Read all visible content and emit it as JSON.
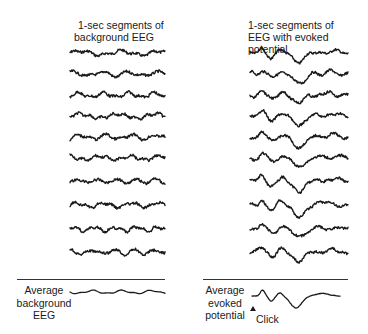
{
  "left_panel": {
    "title_line1": "1-sec segments of",
    "title_line2": "background EEG",
    "trace_count": 10,
    "average_label_line1": "Average",
    "average_label_line2": "background",
    "average_label_line3": "EEG"
  },
  "right_panel": {
    "title_line1": "1-sec segments of",
    "title_line2": "EEG with evoked potential",
    "trace_count": 10,
    "average_label_line1": "Average",
    "average_label_line2": "evoked",
    "average_label_line3": "potential",
    "stimulus_label": "Click",
    "stimulus_marker": "triangle-up-icon"
  },
  "colors": {
    "ink": "#1a1a1a",
    "background": "#ffffff"
  }
}
